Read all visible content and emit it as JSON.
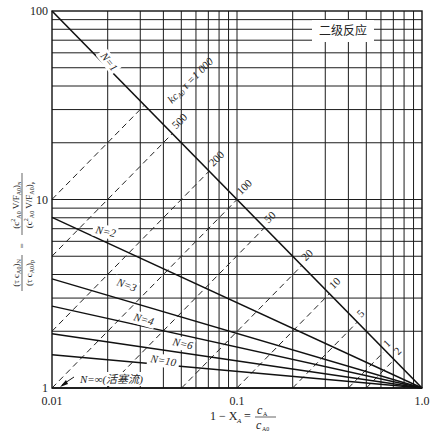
{
  "chart_data": {
    "type": "line",
    "scale": {
      "x": "log",
      "y": "log"
    },
    "title": "二级反应",
    "xlabel": "1 − X_A = c_A / c_A0",
    "ylabel": "(τ c_A0)_N / (τ c_A0)_p = (c_A0² V/F_A0)_N / (c_A0² V/F_A0)_p",
    "xlim": [
      0.01,
      1.0
    ],
    "ylim": [
      1,
      100
    ],
    "x_ticks": [
      "0.01",
      "0.1",
      "1.0"
    ],
    "y_ticks": [
      "1",
      "10",
      "100"
    ],
    "grid": true,
    "series": [
      {
        "name": "N=1",
        "label": "N=1",
        "style": "solid",
        "intercept_at_x0.01": 100
      },
      {
        "name": "N=2",
        "label": "N=2",
        "style": "solid",
        "intercept_at_x0.01": 8.04
      },
      {
        "name": "N=3",
        "label": "N=3",
        "style": "solid",
        "intercept_at_x0.01": 3.79
      },
      {
        "name": "N=4",
        "label": "N=4",
        "style": "solid",
        "intercept_at_x0.01": 2.72
      },
      {
        "name": "N=6",
        "label": "N=6",
        "style": "solid",
        "intercept_at_x0.01": 1.94
      },
      {
        "name": "N=10",
        "label": "N=10",
        "style": "solid",
        "intercept_at_x0.01": 1.5
      },
      {
        "name": "N=∞ (活塞流)",
        "label": "N=∞(活塞流)",
        "style": "solid",
        "intercept_at_x0.01": 1
      }
    ],
    "dashed_series_label_prefix": "kc_A0 τ =",
    "dashed_series": [
      {
        "value": 1000,
        "label": "1 000"
      },
      {
        "value": 500,
        "label": "500"
      },
      {
        "value": 200,
        "label": "200"
      },
      {
        "value": 100,
        "label": "100"
      },
      {
        "value": 50,
        "label": "50"
      },
      {
        "value": 20,
        "label": "20"
      },
      {
        "value": 10,
        "label": "10"
      },
      {
        "value": 5,
        "label": "5"
      },
      {
        "value": 2,
        "label": "2"
      },
      {
        "value": 1,
        "label": "1"
      }
    ],
    "legend": "none (inline labels)"
  },
  "labels": {
    "title": "二级反应",
    "x_axis": "1 − X",
    "x_axis_sub": "A",
    "x_axis_eq": "=",
    "x_frac_num": "c",
    "x_frac_num_sub": "A",
    "x_frac_den": "c",
    "x_frac_den_sub": "A0",
    "plug_flow": "N=∞(活塞流)",
    "k_prefix": "kc",
    "k_sub": "A0",
    "k_suffix": "τ =1 000"
  }
}
